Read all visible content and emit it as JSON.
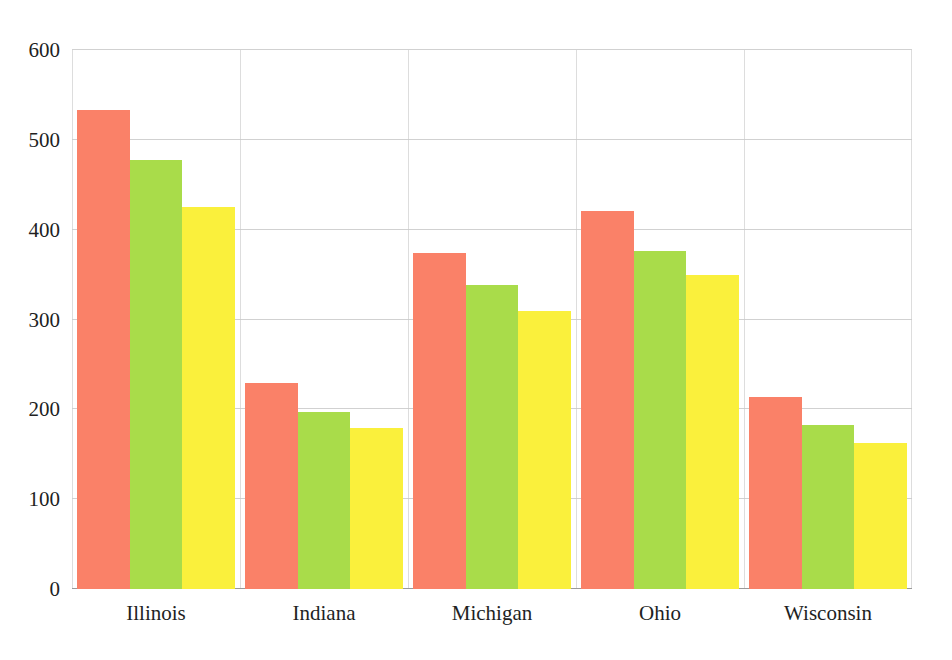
{
  "chart_data": {
    "type": "bar",
    "title": "",
    "subtitle": "",
    "xlabel": "",
    "ylabel": "",
    "categories": [
      "Illinois",
      "Indiana",
      "Michigan",
      "Ohio",
      "Wisconsin"
    ],
    "series": [
      {
        "name": "Series 1",
        "color": "#fa8168",
        "values": [
          533,
          229,
          374,
          421,
          214
        ]
      },
      {
        "name": "Series 2",
        "color": "#a9dc4a",
        "values": [
          478,
          197,
          338,
          376,
          183
        ]
      },
      {
        "name": "Series 3",
        "color": "#faf03c",
        "values": [
          425,
          179,
          310,
          350,
          162
        ]
      }
    ],
    "ylim": [
      0,
      600
    ],
    "yticks": [
      0,
      100,
      200,
      300,
      400,
      500,
      600
    ],
    "ytick_labels": [
      "0",
      "100",
      "200",
      "300",
      "400",
      "500",
      "600"
    ],
    "grid": true,
    "grid_axis": "both",
    "legend": "none",
    "background_color": "#ffffff",
    "gridline_color": "#c9c9c9",
    "axis_text_color": "#221f1f"
  }
}
